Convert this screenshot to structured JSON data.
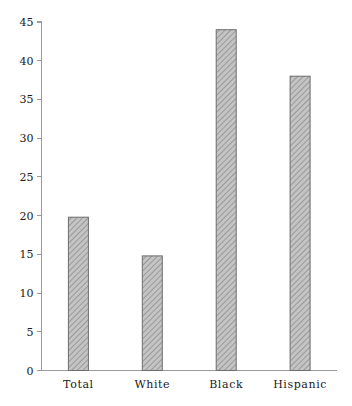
{
  "chart_data": {
    "type": "bar",
    "title": "",
    "subtitle": "",
    "xlabel": "",
    "ylabel": "",
    "categories": [
      "Total",
      "White",
      "Black",
      "Hispanic"
    ],
    "values": [
      19.8,
      14.8,
      44.0,
      38.0
    ],
    "series": [
      {
        "name": "",
        "values": [
          19.8,
          14.8,
          44.0,
          38.0
        ]
      }
    ],
    "ylim": [
      0,
      45
    ],
    "xlim": [
      0,
      4
    ],
    "ytick_labels": [
      "0",
      "5",
      "10",
      "15",
      "20",
      "25",
      "30",
      "35",
      "40",
      "45"
    ],
    "ytick_values": [
      0,
      5,
      10,
      15,
      20,
      25,
      30,
      35,
      40,
      45
    ],
    "grid": false,
    "legend": false,
    "legend_position": "none",
    "annotations": [],
    "bar_fill_color": "#b3b3b3",
    "bar_edge_color": "#6d6d6d",
    "bar_hatch": "diagonal-crosshatch",
    "axis_color": "#9a9a9a",
    "background_color": "#ffffff"
  },
  "axes": {
    "y_axis_name": "y-axis",
    "x_axis_name": "x-axis"
  }
}
